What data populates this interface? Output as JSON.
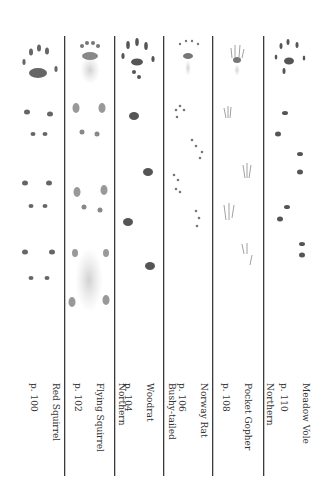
{
  "species": [
    {
      "name": "Red Squirrel",
      "lines": [
        "Red Squirrel",
        "p. 100"
      ],
      "page": "p. 100"
    },
    {
      "name": "Northern Flying Squirrel",
      "lines": [
        "Northern",
        "Flying Squirrel",
        "p. 102"
      ],
      "page": "p. 102"
    },
    {
      "name": "Bushy-tailed Woodrat",
      "lines": [
        "Bushy-tailed",
        "Woodrat",
        "p. 104"
      ],
      "page": "p. 104"
    },
    {
      "name": "Norway Rat",
      "lines": [
        "Norway Rat",
        "p. 106"
      ],
      "page": "p. 106"
    },
    {
      "name": "Northern Pocket Gopher",
      "lines": [
        "Northern",
        "Pocket Gopher",
        "p. 108"
      ],
      "page": "p. 108"
    },
    {
      "name": "Meadow Vole",
      "lines": [
        "Meadow Vole",
        "p. 110"
      ],
      "page": "p. 110"
    }
  ],
  "colors": {
    "ink": "#555555",
    "divider": "#3a3a3a",
    "text": "#333333"
  }
}
